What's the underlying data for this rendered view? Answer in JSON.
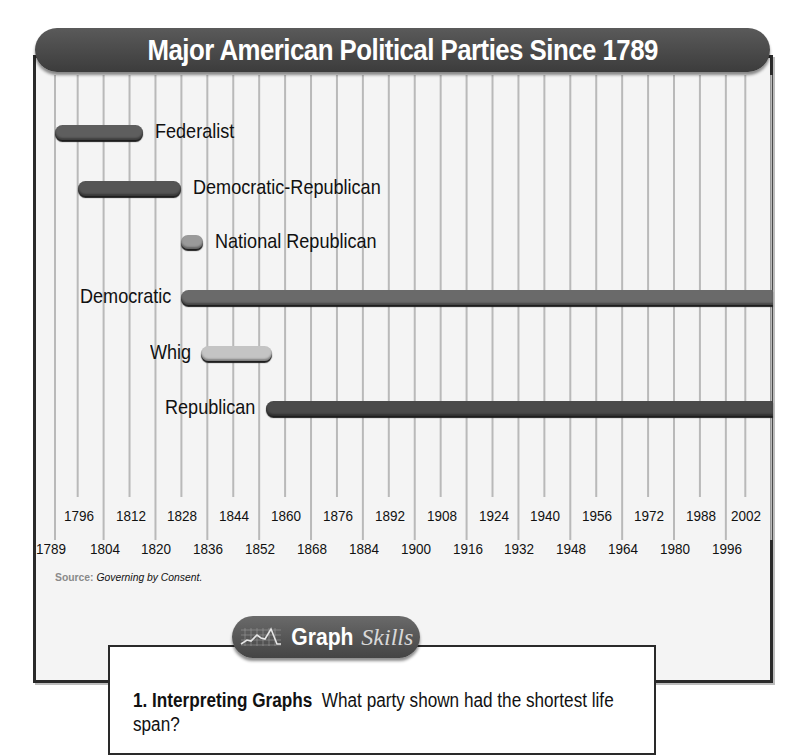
{
  "title": "Major American Political Parties Since 1789",
  "chart_data": {
    "type": "timeline",
    "title": "Major American Political Parties Since 1789",
    "xlabel": "",
    "ylabel": "",
    "xlim": [
      1789,
      2010
    ],
    "grid": true,
    "tick_labels_top_row": [
      "1796",
      "1812",
      "1828",
      "1844",
      "1860",
      "1876",
      "1892",
      "1908",
      "1924",
      "1940",
      "1956",
      "1972",
      "1988",
      "2002"
    ],
    "tick_labels_bottom_row": [
      "1789",
      "1804",
      "1820",
      "1836",
      "1852",
      "1868",
      "1884",
      "1900",
      "1916",
      "1932",
      "1948",
      "1964",
      "1980",
      "1996"
    ],
    "series": [
      {
        "name": "Federalist",
        "start": 1789,
        "end": 1816,
        "color": "#5e5e5e"
      },
      {
        "name": "Democratic-Republican",
        "start": 1796,
        "end": 1828,
        "color": "#555555"
      },
      {
        "name": "National Republican",
        "start": 1828,
        "end": 1834,
        "color": "#9a9a9a"
      },
      {
        "name": "Democratic",
        "start": 1828,
        "end": "present",
        "color": "#6a6a6a"
      },
      {
        "name": "Whig",
        "start": 1834,
        "end": 1856,
        "color": "#c4c4c4"
      },
      {
        "name": "Republican",
        "start": 1854,
        "end": "present",
        "color": "#4a4a4a"
      }
    ]
  },
  "source": {
    "label": "Source:",
    "text": "Governing by Consent."
  },
  "graph_skills": {
    "title_bold": "Graph",
    "title_italic": "Skills",
    "question_number": "1.",
    "question_heading": "Interpreting Graphs",
    "question_text": "What party shown had the shortest life span?"
  }
}
